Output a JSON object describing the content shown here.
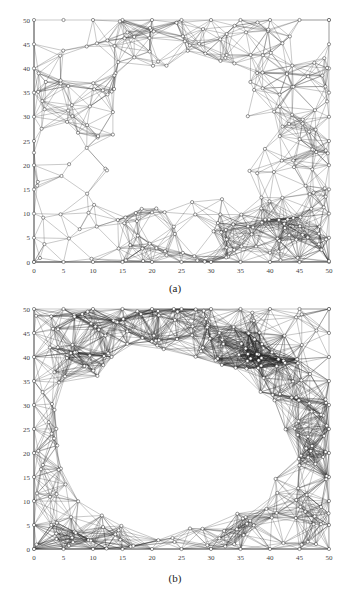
{
  "figure": {
    "panels": [
      {
        "id": "a",
        "caption": "(a)",
        "x_ticks": [
          "0",
          "5",
          "10",
          "15",
          "20",
          "25",
          "30",
          "35",
          "40",
          "45",
          "50"
        ],
        "y_ticks": [
          "0",
          "5",
          "10",
          "15",
          "20",
          "25",
          "30",
          "35",
          "40",
          "45",
          "50"
        ],
        "xlim": [
          0,
          50
        ],
        "ylim": [
          0,
          50
        ],
        "description": "Random sensor network in 50x50 field with rectangular hole near center (approx x 13-37, y 13-40)",
        "hole": {
          "type": "rectangle",
          "x0": 14,
          "x1": 36,
          "y0": 13,
          "y1": 40
        }
      },
      {
        "id": "b",
        "caption": "(b)",
        "x_ticks": [
          "0",
          "5",
          "10",
          "15",
          "20",
          "25",
          "30",
          "35",
          "40",
          "45",
          "50"
        ],
        "y_ticks": [
          "0",
          "5",
          "10",
          "15",
          "20",
          "25",
          "30",
          "35",
          "40",
          "45",
          "50"
        ],
        "xlim": [
          0,
          50
        ],
        "ylim": [
          0,
          50
        ],
        "description": "Sensor network in 50x50 field with large elliptical hole, center approx (23,22), radii approx 18x18",
        "hole": {
          "type": "ellipse",
          "cx": 23,
          "cy": 22,
          "rx": 19,
          "ry": 18
        }
      }
    ]
  }
}
